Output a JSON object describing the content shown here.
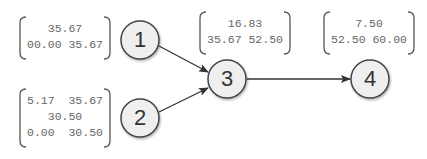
{
  "nodes": [
    {
      "id": "1",
      "label": "1",
      "matrix": [
        "35.67",
        "00.00 35.67"
      ]
    },
    {
      "id": "2",
      "label": "2",
      "matrix": [
        "5.17  35.67",
        "30.50",
        "0.00  30.50"
      ]
    },
    {
      "id": "3",
      "label": "3",
      "matrix": [
        "16.83",
        "35.67 52.50"
      ]
    },
    {
      "id": "4",
      "label": "4",
      "matrix": [
        "7.50",
        "52.50 60.00"
      ]
    }
  ],
  "edges": [
    {
      "from": "1",
      "to": "3"
    },
    {
      "from": "2",
      "to": "3"
    },
    {
      "from": "3",
      "to": "4"
    }
  ],
  "colors": {
    "node_fill": "#efefef",
    "node_stroke": "#444444",
    "edge": "#333333",
    "bracket": "#555555",
    "text": "#666666"
  }
}
